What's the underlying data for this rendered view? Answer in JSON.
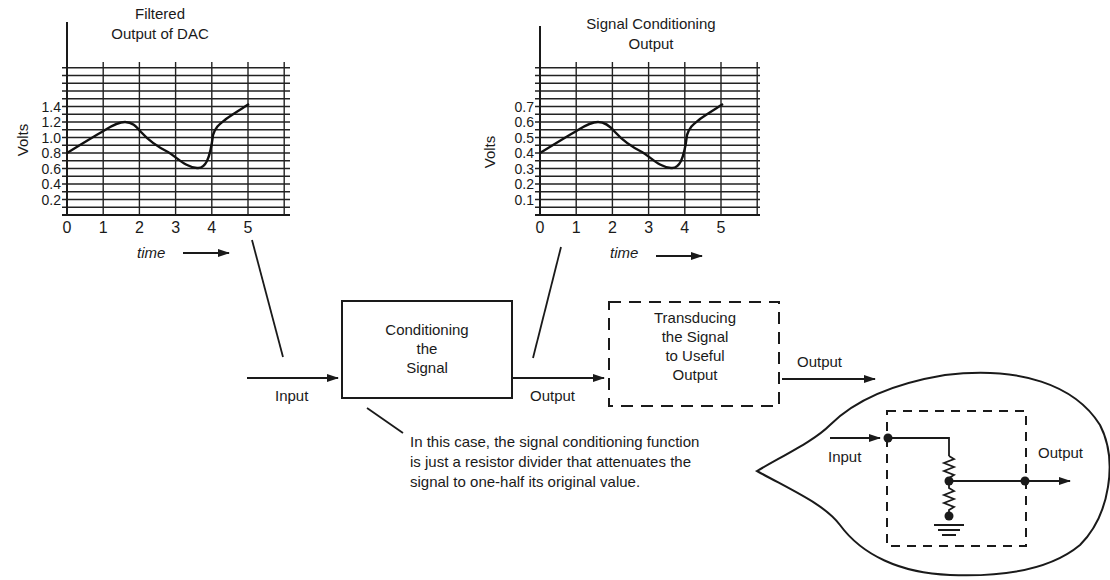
{
  "chart_data": [
    {
      "type": "line",
      "title": "Filtered Output of DAC",
      "title_lines": [
        "Filtered",
        "Output of DAC"
      ],
      "xlabel": "time",
      "ylabel": "Volts",
      "x_ticks": [
        "0",
        "1",
        "2",
        "3",
        "4",
        "5"
      ],
      "y_ticks": [
        "0.2",
        "0.4",
        "0.6",
        "0.8",
        "1.0",
        "1.2",
        "1.4"
      ],
      "xlim": [
        0,
        6
      ],
      "ylim": [
        0,
        1.9
      ],
      "grid": true,
      "x": [
        0,
        0.5,
        1.0,
        1.5,
        1.8,
        2.0,
        2.5,
        3.0,
        3.5,
        3.8,
        4.0,
        4.3,
        5.0
      ],
      "values": [
        0.8,
        0.95,
        1.1,
        1.17,
        1.12,
        1.0,
        0.85,
        0.75,
        0.6,
        0.66,
        1.05,
        1.18,
        1.4
      ]
    },
    {
      "type": "line",
      "title": "Signal Conditioning Output",
      "title_lines": [
        "Signal Conditioning",
        "Output"
      ],
      "xlabel": "time",
      "ylabel": "Volts",
      "x_ticks": [
        "0",
        "1",
        "2",
        "3",
        "4",
        "5"
      ],
      "y_ticks": [
        "0.1",
        "0.2",
        "0.3",
        "0.4",
        "0.5",
        "0.6",
        "0.7"
      ],
      "xlim": [
        0,
        6
      ],
      "ylim": [
        0,
        0.95
      ],
      "grid": true,
      "x": [
        0,
        0.5,
        1.0,
        1.5,
        1.8,
        2.0,
        2.5,
        3.0,
        3.5,
        3.8,
        4.0,
        4.3,
        5.0
      ],
      "values": [
        0.4,
        0.475,
        0.55,
        0.585,
        0.56,
        0.5,
        0.425,
        0.375,
        0.3,
        0.33,
        0.525,
        0.59,
        0.7
      ]
    }
  ],
  "chart1": {
    "title_line1": "Filtered",
    "title_line2": "Output of DAC",
    "ylabel": "Volts",
    "xlabel": "time",
    "y_ticks": [
      "0.2",
      "0.4",
      "0.6",
      "0.8",
      "1.0",
      "1.2",
      "1.4"
    ],
    "x_ticks": [
      "0",
      "1",
      "2",
      "3",
      "4",
      "5"
    ]
  },
  "chart2": {
    "title_line1": "Signal Conditioning",
    "title_line2": "Output",
    "ylabel": "Volts",
    "xlabel": "time",
    "y_ticks": [
      "0.1",
      "0.2",
      "0.3",
      "0.4",
      "0.5",
      "0.6",
      "0.7"
    ],
    "x_ticks": [
      "0",
      "1",
      "2",
      "3",
      "4",
      "5"
    ]
  },
  "flow": {
    "input_label": "Input",
    "conditioning_block": [
      "Conditioning",
      "the",
      "Signal"
    ],
    "output_label_1": "Output",
    "transducing_block": [
      "Transducing",
      "the Signal",
      "to Useful",
      "Output"
    ],
    "output_label_2": "Output"
  },
  "callout": {
    "lines": [
      "In this case, the signal conditioning function",
      "is just a resistor divider that attenuates the",
      "signal to one-half its original value."
    ]
  },
  "circuit": {
    "input_label": "Input",
    "output_label": "Output"
  }
}
